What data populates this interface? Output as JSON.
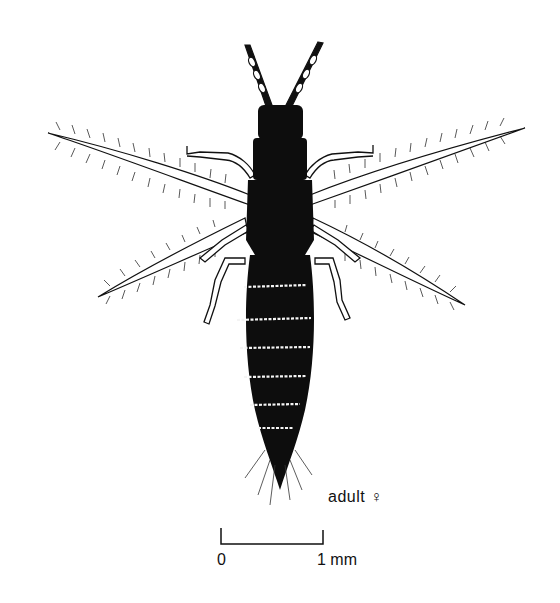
{
  "figure": {
    "caption": "adult ♀",
    "scale_bar": {
      "start_label": "0",
      "end_label": "1 mm"
    },
    "colors": {
      "ink": "#111111",
      "background": "#ffffff"
    }
  }
}
